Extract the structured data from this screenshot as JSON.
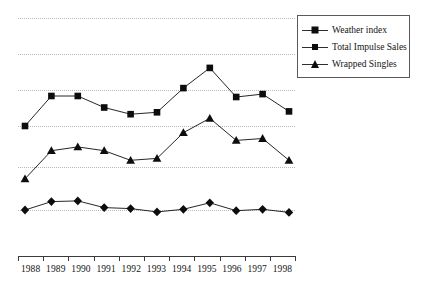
{
  "chart_data": {
    "type": "line",
    "title": "",
    "xlabel": "",
    "ylabel": "",
    "grid": true,
    "legend_position": "top-right",
    "categories": [
      "1988",
      "1989",
      "1990",
      "1991",
      "1992",
      "1993",
      "1994",
      "1995",
      "1996",
      "1997",
      "1998"
    ],
    "ylim": [
      0,
      100
    ],
    "gridline_values": [
      100,
      85,
      70,
      55,
      38,
      20
    ],
    "series": [
      {
        "name": "Weather index",
        "marker": "diamond",
        "color": "#0d0d0d",
        "values": [
          20.0,
          23.5,
          23.8,
          21.0,
          20.6,
          19.2,
          20.3,
          23.0,
          19.7,
          20.3,
          19.0
        ]
      },
      {
        "name": "Total Impulse Sales",
        "marker": "square",
        "color": "#0d0d0d",
        "values": [
          55.0,
          67.5,
          67.5,
          62.7,
          59.9,
          60.7,
          70.8,
          79.2,
          67.1,
          68.3,
          61.1
        ]
      },
      {
        "name": "Wrapped Singles",
        "marker": "triangle",
        "color": "#0d0d0d",
        "values": [
          33.0,
          44.7,
          46.3,
          44.7,
          40.7,
          41.5,
          52.2,
          58.2,
          49.0,
          49.8,
          40.7
        ]
      }
    ]
  },
  "legend": {
    "items": [
      {
        "label": "Weather index",
        "marker": "diamond"
      },
      {
        "label": "Total Impulse Sales",
        "marker": "square"
      },
      {
        "label": "Wrapped Singles",
        "marker": "triangle"
      }
    ]
  },
  "axis": {
    "x_tick_labels": [
      "1988",
      "1989",
      "1990",
      "1991",
      "1992",
      "1993",
      "1994",
      "1995",
      "1996",
      "1997",
      "1998"
    ]
  },
  "style": {
    "line_color": "#2e2e2e",
    "marker_color": "#0d0d0d",
    "grid_color": "#b9b9b9",
    "axis_color": "#3b3b3b",
    "background": "#ffffff"
  }
}
